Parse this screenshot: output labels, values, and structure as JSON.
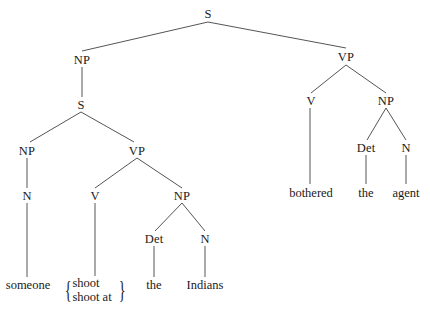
{
  "diagram": {
    "type": "syntax-tree",
    "line_color": "#555555",
    "nodes": {
      "root_s": {
        "label": "S",
        "x": 208,
        "y": 14
      },
      "np_top": {
        "label": "NP",
        "x": 82,
        "y": 60
      },
      "vp_top": {
        "label": "VP",
        "x": 346,
        "y": 57
      },
      "s_embedded": {
        "label": "S",
        "x": 81,
        "y": 105
      },
      "np_subj": {
        "label": "NP",
        "x": 27,
        "y": 151
      },
      "vp_embedded": {
        "label": "VP",
        "x": 137,
        "y": 151
      },
      "n_subj": {
        "label": "N",
        "x": 27,
        "y": 196
      },
      "v_embedded": {
        "label": "V",
        "x": 95,
        "y": 196
      },
      "np_obj": {
        "label": "NP",
        "x": 182,
        "y": 196
      },
      "det_obj": {
        "label": "Det",
        "x": 154,
        "y": 239
      },
      "n_obj": {
        "label": "N",
        "x": 205,
        "y": 239
      },
      "v_main": {
        "label": "V",
        "x": 311,
        "y": 101
      },
      "np_main": {
        "label": "NP",
        "x": 386,
        "y": 101
      },
      "det_main": {
        "label": "Det",
        "x": 366,
        "y": 148
      },
      "n_main": {
        "label": "N",
        "x": 406,
        "y": 148
      }
    },
    "leaves": {
      "someone": {
        "label": "someone",
        "x": 28,
        "y": 285
      },
      "the_1": {
        "label": "the",
        "x": 154,
        "y": 285
      },
      "indians": {
        "label": "Indians",
        "x": 205,
        "y": 285
      },
      "bothered": {
        "label": "bothered",
        "x": 311,
        "y": 193
      },
      "the_2": {
        "label": "the",
        "x": 366,
        "y": 193
      },
      "agent": {
        "label": "agent",
        "x": 406,
        "y": 193
      }
    },
    "alternatives": {
      "verb_choice": {
        "x": 95,
        "y": 291,
        "left_brace": "{",
        "right_brace": "}",
        "items": [
          "shoot",
          "shoot at"
        ]
      }
    },
    "edges": [
      {
        "from": [
          208,
          22
        ],
        "to": [
          82,
          51
        ]
      },
      {
        "from": [
          208,
          22
        ],
        "to": [
          346,
          48
        ]
      },
      {
        "from": [
          82,
          67
        ],
        "to": [
          82,
          97
        ]
      },
      {
        "from": [
          81,
          112
        ],
        "to": [
          30,
          142
        ]
      },
      {
        "from": [
          81,
          112
        ],
        "to": [
          134,
          142
        ]
      },
      {
        "from": [
          27,
          158
        ],
        "to": [
          27,
          188
        ]
      },
      {
        "from": [
          137,
          158
        ],
        "to": [
          95,
          188
        ]
      },
      {
        "from": [
          137,
          158
        ],
        "to": [
          182,
          188
        ]
      },
      {
        "from": [
          182,
          203
        ],
        "to": [
          155,
          231
        ]
      },
      {
        "from": [
          182,
          203
        ],
        "to": [
          205,
          231
        ]
      },
      {
        "from": [
          27,
          203
        ],
        "to": [
          27,
          277
        ]
      },
      {
        "from": [
          95,
          203
        ],
        "to": [
          95,
          276
        ]
      },
      {
        "from": [
          154,
          246
        ],
        "to": [
          154,
          277
        ]
      },
      {
        "from": [
          205,
          246
        ],
        "to": [
          205,
          277
        ]
      },
      {
        "from": [
          346,
          65
        ],
        "to": [
          311,
          93
        ]
      },
      {
        "from": [
          346,
          65
        ],
        "to": [
          386,
          93
        ]
      },
      {
        "from": [
          386,
          108
        ],
        "to": [
          367,
          140
        ]
      },
      {
        "from": [
          386,
          108
        ],
        "to": [
          406,
          140
        ]
      },
      {
        "from": [
          310,
          108
        ],
        "to": [
          310,
          184
        ]
      },
      {
        "from": [
          366,
          155
        ],
        "to": [
          366,
          184
        ]
      },
      {
        "from": [
          406,
          155
        ],
        "to": [
          406,
          184
        ]
      }
    ]
  }
}
